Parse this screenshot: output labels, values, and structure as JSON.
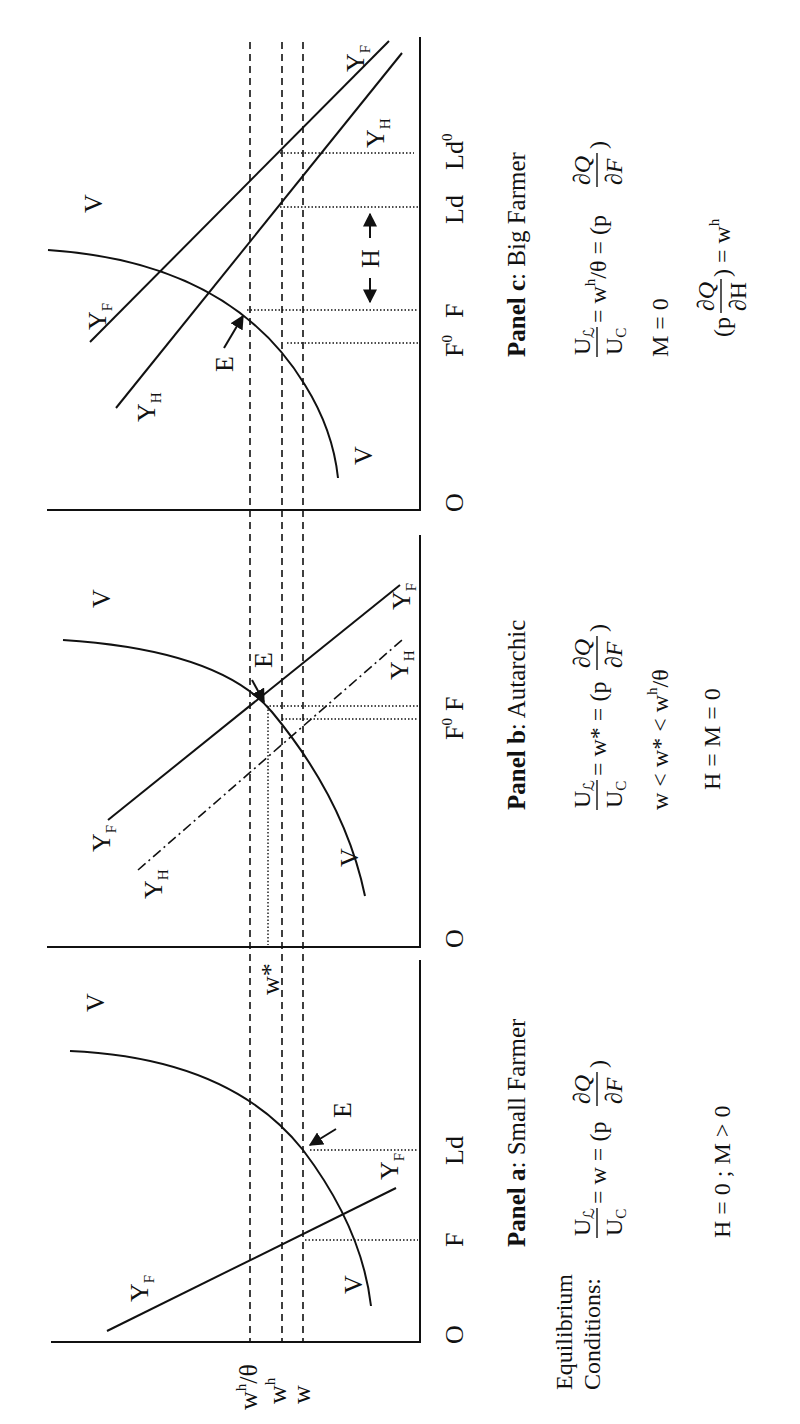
{
  "figure": {
    "orientation": "rotated 90 degrees counter-clockwise",
    "wage_lines": [
      {
        "id": "wh_theta",
        "label": "w",
        "sup": "h",
        "suffix": "/θ",
        "style": "dashed"
      },
      {
        "id": "wh",
        "label": "w",
        "sup": "h",
        "suffix": "",
        "style": "dashed"
      },
      {
        "id": "w",
        "label": "w",
        "sup": "",
        "suffix": "",
        "style": "dashed"
      }
    ],
    "wstar_label": "w*",
    "origin_label": "O",
    "curve_label_V": "V",
    "curve_label_Y": "Y",
    "sub_F": "F",
    "sub_H": "H",
    "equilibrium_label": "E",
    "equilibrium_heading_line1": "Equilibrium",
    "equilibrium_heading_line2": "Conditions:",
    "panels": [
      {
        "id": "a",
        "title_bold": "Panel a",
        "title_rest": ": Small Farmer",
        "x_labels": [
          "F",
          "Ld"
        ],
        "conditions": [
          {
            "lhs_num": "U",
            "lhs_num_sub": "ℒ",
            "lhs_den": "U",
            "lhs_den_sub": "C",
            "rhs": "= w = (p",
            "frac_num": "∂Q",
            "frac_den": "∂F",
            "close": ")"
          },
          {
            "text": "H = 0 ; M > 0"
          }
        ]
      },
      {
        "id": "b",
        "title_bold": "Panel b",
        "title_rest": ": Autarchic",
        "x_labels": [
          "F",
          "F"
        ],
        "x_label_sups": [
          "0",
          ""
        ],
        "conditions": [
          {
            "lhs_num": "U",
            "lhs_num_sub": "ℒ",
            "lhs_den": "U",
            "lhs_den_sub": "C",
            "rhs": "= w* = (p",
            "frac_num": "∂Q",
            "frac_den": "∂F",
            "close": ")"
          },
          {
            "text": "w < w* < w",
            "sup": "h",
            "tail": "/θ"
          },
          {
            "text": "H = M = 0"
          }
        ]
      },
      {
        "id": "c",
        "title_bold": "Panel c",
        "title_rest": ": Big Farmer",
        "x_labels": [
          "F",
          "F",
          "Ld",
          "Ld"
        ],
        "x_label_sups": [
          "0",
          "",
          "",
          "0"
        ],
        "h_span_label": "H",
        "conditions": [
          {
            "lhs_num": "U",
            "lhs_num_sub": "ℒ",
            "lhs_den": "U",
            "lhs_den_sub": "C",
            "rhs": "= w",
            "rhs_sup": "h",
            "rhs_tail": "/θ = (p",
            "frac_num": "∂Q",
            "frac_den": "∂F",
            "close": ")"
          },
          {
            "text": "M = 0"
          },
          {
            "pre": "(p",
            "frac_num": "∂Q",
            "frac_den": "∂H",
            "post": ") = w",
            "post_sup": "h"
          }
        ]
      }
    ]
  }
}
